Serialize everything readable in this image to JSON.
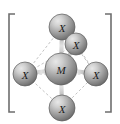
{
  "figure": {
    "kind": "coordination-complex-structure",
    "background_color": "#ffffff",
    "bracket": {
      "name": "square-bracket",
      "color": "#6e6e6e",
      "left_x": 9,
      "right_x": 111,
      "top_y": 14,
      "bottom_y": 112,
      "arm_length": 6,
      "stroke_width": 1.6
    },
    "geometry_name": "octahedral",
    "bond_color": "#9a9a9a",
    "bond_highlight_color": "#d8d8d8",
    "dashed_color": "#b0b0b0",
    "sphere_fill_light": "#d9d9d9",
    "sphere_fill_mid": "#9b9b9b",
    "sphere_fill_dark": "#6a6a6a",
    "sphere_outline": "#5c5c5c",
    "atoms": [
      {
        "id": "ligand-top",
        "label": "X",
        "role": "ligand",
        "cx": 62,
        "cy": 27,
        "r": 13
      },
      {
        "id": "ligand-back-right",
        "label": "X",
        "role": "ligand",
        "cx": 76,
        "cy": 44,
        "r": 11
      },
      {
        "id": "ligand-left",
        "label": "X",
        "role": "ligand",
        "cx": 25,
        "cy": 74,
        "r": 12
      },
      {
        "id": "metal-center",
        "label": "M",
        "role": "metal",
        "cx": 61,
        "cy": 69,
        "r": 16
      },
      {
        "id": "ligand-right",
        "label": "X",
        "role": "ligand",
        "cx": 96,
        "cy": 74,
        "r": 12
      },
      {
        "id": "ligand-bottom",
        "label": "X",
        "role": "ligand",
        "cx": 62,
        "cy": 108,
        "r": 13
      }
    ],
    "bonds": [
      {
        "id": "bond-metal-top",
        "from": "metal-center",
        "to": "ligand-top",
        "style": "solid"
      },
      {
        "id": "bond-metal-back-right",
        "from": "metal-center",
        "to": "ligand-back-right",
        "style": "solid"
      },
      {
        "id": "bond-metal-left",
        "from": "metal-center",
        "to": "ligand-left",
        "style": "solid"
      },
      {
        "id": "bond-metal-right",
        "from": "metal-center",
        "to": "ligand-right",
        "style": "solid"
      },
      {
        "id": "bond-metal-bottom",
        "from": "metal-center",
        "to": "ligand-bottom",
        "style": "solid"
      }
    ],
    "guides": [
      {
        "id": "guide-top-left",
        "from": "ligand-top",
        "to": "ligand-left",
        "style": "dashed"
      },
      {
        "id": "guide-top-right",
        "from": "ligand-top",
        "to": "ligand-right",
        "style": "dashed"
      },
      {
        "id": "guide-left-right",
        "from": "ligand-left",
        "to": "ligand-right",
        "style": "dashed"
      },
      {
        "id": "guide-left-back",
        "from": "ligand-left",
        "to": "ligand-back-right",
        "style": "dashed"
      },
      {
        "id": "guide-back-right",
        "from": "ligand-back-right",
        "to": "ligand-right",
        "style": "dashed"
      },
      {
        "id": "guide-left-bottom",
        "from": "ligand-left",
        "to": "ligand-bottom",
        "style": "dashed"
      },
      {
        "id": "guide-bottom-right",
        "from": "ligand-bottom",
        "to": "ligand-right",
        "style": "dashed"
      }
    ]
  }
}
